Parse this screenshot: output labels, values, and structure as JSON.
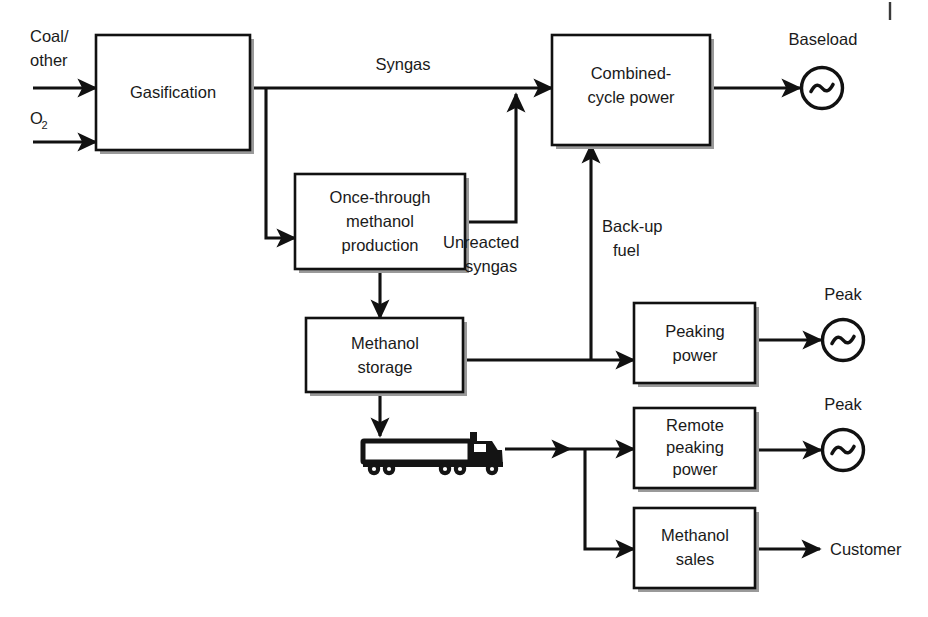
{
  "diagram": {
    "type": "process-flow-block-diagram",
    "background_color": "#ffffff",
    "line_color": "#111111",
    "text_color": "#1a1a1a"
  },
  "boxes": [
    {
      "id": "gasification",
      "label": "Gasification",
      "lines": [
        "Gasification"
      ]
    },
    {
      "id": "once_through",
      "label": "Once-through methanol production",
      "lines": [
        "Once-through",
        "methanol",
        "production"
      ]
    },
    {
      "id": "methanol_storage",
      "label": "Methanol storage",
      "lines": [
        "Methanol",
        "storage"
      ]
    },
    {
      "id": "combined_cycle",
      "label": "Combined-cycle power",
      "lines": [
        "Combined-",
        "cycle power"
      ]
    },
    {
      "id": "peaking_power",
      "label": "Peaking power",
      "lines": [
        "Peaking",
        "power"
      ]
    },
    {
      "id": "remote_peaking",
      "label": "Remote peaking power",
      "lines": [
        "Remote",
        "peaking",
        "power"
      ]
    },
    {
      "id": "methanol_sales",
      "label": "Methanol sales",
      "lines": [
        "Methanol",
        "sales"
      ]
    }
  ],
  "inputs": [
    {
      "id": "coal_other",
      "lines": [
        "Coal/",
        "other"
      ]
    },
    {
      "id": "oxygen",
      "text": "O",
      "subscript": "2"
    }
  ],
  "flow_labels": [
    {
      "id": "syngas",
      "lines": [
        "Syngas"
      ]
    },
    {
      "id": "unreacted_syngas",
      "lines": [
        "Unreacted",
        "syngas"
      ]
    },
    {
      "id": "backup_fuel",
      "lines": [
        "Back-up",
        "fuel"
      ]
    }
  ],
  "outputs": [
    {
      "id": "baseload",
      "label": "Baseload",
      "symbol": "generator"
    },
    {
      "id": "peak_1",
      "label": "Peak",
      "symbol": "generator"
    },
    {
      "id": "peak_2",
      "label": "Peak",
      "symbol": "generator"
    },
    {
      "id": "customer",
      "label": "Customer",
      "symbol": "arrow"
    }
  ],
  "icons": [
    {
      "id": "truck",
      "name": "tanker-truck-icon",
      "description": "semi truck with trailer hauling methanol"
    }
  ]
}
